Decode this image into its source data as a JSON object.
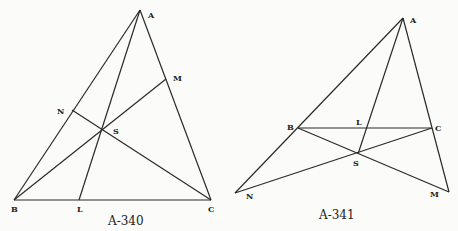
{
  "figures": [
    {
      "caption": "A-340",
      "points": {
        "A": {
          "label": "A",
          "x": 140,
          "y": 10
        },
        "B": {
          "label": "B",
          "x": 14,
          "y": 200
        },
        "C": {
          "label": "C",
          "x": 211,
          "y": 200
        },
        "L": {
          "label": "L",
          "x": 79,
          "y": 200
        },
        "M": {
          "label": "M",
          "x": 166,
          "y": 79
        },
        "N": {
          "label": "N",
          "x": 72,
          "y": 110
        },
        "S": {
          "label": "S",
          "x": 102,
          "y": 130
        }
      }
    },
    {
      "caption": "A-341",
      "points": {
        "A": {
          "label": "A",
          "x": 403,
          "y": 18
        },
        "B": {
          "label": "B",
          "x": 298,
          "y": 128
        },
        "C": {
          "label": "C",
          "x": 432,
          "y": 128
        },
        "L": {
          "label": "L",
          "x": 367,
          "y": 128
        },
        "S": {
          "label": "S",
          "x": 358,
          "y": 154
        },
        "N": {
          "label": "N",
          "x": 235,
          "y": 193
        },
        "M": {
          "label": "M",
          "x": 449,
          "y": 192
        }
      }
    }
  ]
}
